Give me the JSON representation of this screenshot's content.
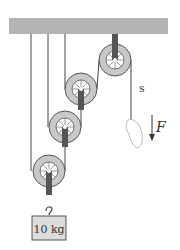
{
  "diagram": {
    "type": "pulley-system",
    "colors": {
      "ceiling": "#b3b3b3",
      "rope": "#444444",
      "pulley_rim": "#c8c8c8",
      "pulley_edge": "#555555",
      "strap": "#555555",
      "mass_fill": "#dcdcdc",
      "mass_edge": "#555555"
    },
    "labels": {
      "displacement": "s",
      "force": "F",
      "mass": "10 kg"
    },
    "pulleys": [
      {
        "name": "fixed-pulley",
        "cx": 115,
        "cy": 60,
        "r": 16
      },
      {
        "name": "movable-pulley-1",
        "cx": 81,
        "cy": 89,
        "r": 16
      },
      {
        "name": "movable-pulley-2",
        "cx": 65,
        "cy": 127,
        "r": 16
      },
      {
        "name": "movable-pulley-3",
        "cx": 49,
        "cy": 171,
        "r": 16
      }
    ]
  }
}
